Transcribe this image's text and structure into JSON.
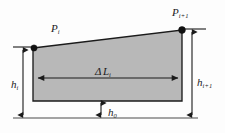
{
  "figure": {
    "name": "trapezoidal-segment-height-diagram",
    "background_color": "#fdfdfd",
    "fill_color": "#b8b8b8",
    "stroke_color": "#1b1b1b",
    "node_color": "#111111"
  },
  "labels": {
    "p_i": {
      "base": "P",
      "sub": "i"
    },
    "p_i_plus_1": {
      "base": "P",
      "sub": "i+1"
    },
    "delta_l_i": {
      "greek": "Δ",
      "base": "L",
      "sub": "i"
    },
    "h_i": {
      "base": "h",
      "sub": "i"
    },
    "h_i_plus_1": {
      "base": "h",
      "sub": "i+1"
    },
    "h_0": {
      "base": "h",
      "sub": "0"
    }
  },
  "geometry": {
    "polygon_points": "33,48 182,30 182,101 33,101",
    "baseline": {
      "x1": 13,
      "y1": 118,
      "x2": 198,
      "y2": 118
    },
    "tick_left": {
      "x1": 13,
      "y1": 47,
      "x2": 36,
      "y2": 47
    },
    "tick_right": {
      "x1": 179,
      "y1": 29,
      "x2": 206,
      "y2": 29
    },
    "dim_h_i": {
      "x": 23,
      "y_top": 47,
      "y_bottom": 118
    },
    "dim_h_i_plus_1": {
      "x": 192,
      "y_top": 29,
      "y_bottom": 118
    },
    "dim_h_0": {
      "x": 101,
      "y_top": 101,
      "y_bottom": 118
    },
    "dim_delta_l": {
      "y": 78,
      "x_left": 36,
      "x_right": 180
    },
    "node_p_i": {
      "cx": 34,
      "cy": 48,
      "r": 3.1
    },
    "node_p_i_plus_1": {
      "cx": 182,
      "cy": 30,
      "r": 3.4
    }
  }
}
